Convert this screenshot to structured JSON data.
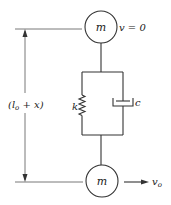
{
  "diagram": {
    "title": "",
    "top_mass": {
      "label": "m",
      "velocity_label": "v = 0"
    },
    "bottom_mass": {
      "label": "m",
      "velocity_label": "v",
      "velocity_subscript": "o"
    },
    "spring": {
      "label": "k"
    },
    "dashpot": {
      "label": "c"
    },
    "dimension": {
      "open": "(",
      "symbol": "l",
      "subscript": "o",
      "plus": " + x",
      "close": ")"
    },
    "colors": {
      "line": "#333333",
      "background": "#ffffff"
    }
  }
}
